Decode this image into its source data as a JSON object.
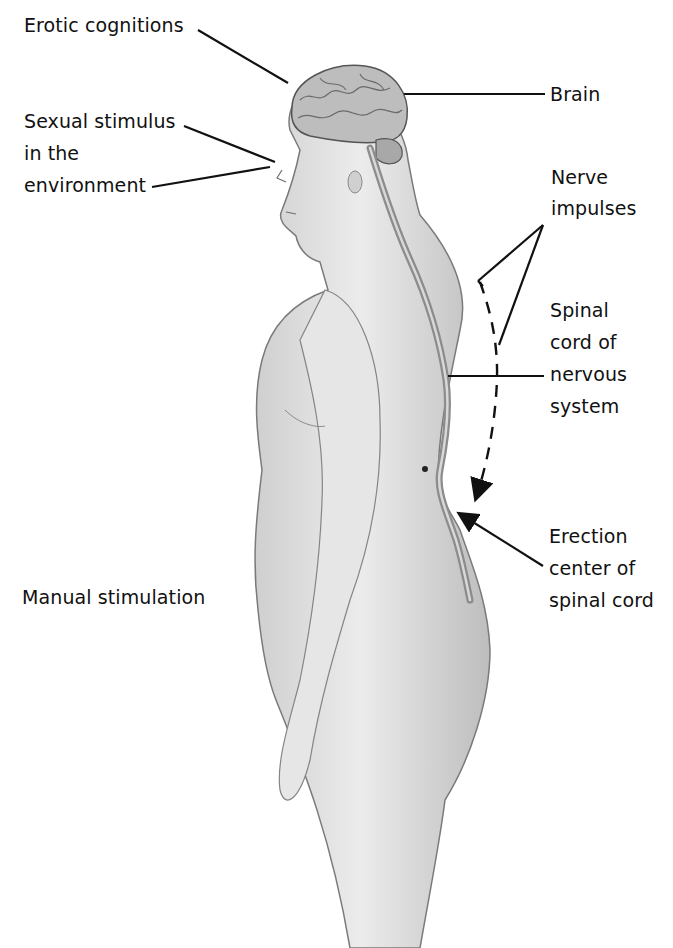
{
  "figure": {
    "labels": {
      "erotic_cognitions": "Erotic cognitions",
      "sexual_stimulus_line1": "Sexual stimulus",
      "sexual_stimulus_line2": "in the",
      "sexual_stimulus_line3": "environment",
      "brain": "Brain",
      "nerve_impulses_line1": "Nerve",
      "nerve_impulses_line2": "impulses",
      "spinal_cord_line1": "Spinal",
      "spinal_cord_line2": "cord of",
      "spinal_cord_line3": "nervous",
      "spinal_cord_line4": "system",
      "erection_center_line1": "Erection",
      "erection_center_line2": "center of",
      "erection_center_line3": "spinal cord",
      "manual_stimulation": "Manual stimulation"
    },
    "colors": {
      "background": "#ffffff",
      "ink": "#111111",
      "skin_light": "#e4e4e4",
      "skin_shade": "#a9a9a9",
      "outline": "#7a7a7a",
      "brain": "#bdbdbd",
      "spinal_cord": "#8c8c8c"
    }
  }
}
